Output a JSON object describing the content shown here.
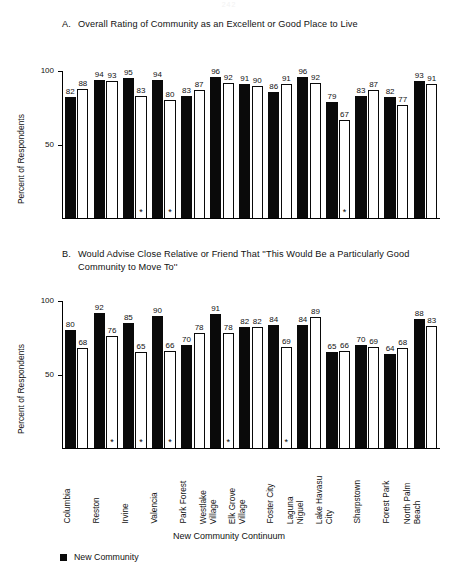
{
  "page": {
    "number": "242"
  },
  "yaxis": {
    "label": "Percent of Respondents",
    "ticks": [
      "100",
      "50"
    ],
    "min": 0,
    "max": 100
  },
  "xaxis": {
    "label": "New Community Continuum"
  },
  "legend": {
    "items": [
      {
        "swatch": "filled-square",
        "label": "New Community"
      }
    ]
  },
  "charts": [
    {
      "letter": "A.",
      "title": "Overall Rating of Community as an Excellent or Good Place to Live"
    },
    {
      "letter": "B.",
      "title": "Would Advise Close Relative or Friend That ''This Would Be a Particularly Good Community to Move To''"
    }
  ],
  "chart_data": [
    {
      "type": "bar",
      "title": "A. Overall Rating of Community as an Excellent or Good Place to Live",
      "xlabel": "New Community Continuum",
      "ylabel": "Percent of Respondents",
      "ylim": [
        0,
        100
      ],
      "yticks": [
        50,
        100
      ],
      "grid": false,
      "legend_position": "bottom-left",
      "categories": [
        "Columbia",
        "Reston",
        "Irvine",
        "Valencia",
        "Park Forest",
        "Westlake Village",
        "Elk Grove Village",
        "Foster City",
        "Laguna Niguel",
        "Lake Havasu City",
        "Sharpstown",
        "Forest Park",
        "North Palm Beach"
      ],
      "series": [
        {
          "name": "New Community",
          "fill": "black",
          "values": [
            82,
            94,
            95,
            94,
            83,
            96,
            91,
            86,
            96,
            79,
            83,
            82,
            93
          ]
        },
        {
          "name": "Conventional Community",
          "fill": "white",
          "values": [
            88,
            93,
            83,
            80,
            87,
            92,
            90,
            91,
            92,
            67,
            87,
            77,
            91
          ]
        }
      ],
      "significance_markers": {
        "series": "Conventional Community",
        "categories": [
          "Irvine",
          "Valencia",
          "Lake Havasu City"
        ]
      }
    },
    {
      "type": "bar",
      "title": "B. Would Advise Close Relative or Friend That ''This Would Be a Particularly Good Community to Move To''",
      "xlabel": "New Community Continuum",
      "ylabel": "Percent of Respondents",
      "ylim": [
        0,
        100
      ],
      "yticks": [
        50,
        100
      ],
      "grid": false,
      "legend_position": "bottom-left",
      "categories": [
        "Columbia",
        "Reston",
        "Irvine",
        "Valencia",
        "Park Forest",
        "Westlake Village",
        "Elk Grove Village",
        "Foster City",
        "Laguna Niguel",
        "Lake Havasu City",
        "Sharpstown",
        "Forest Park",
        "North Palm Beach"
      ],
      "series": [
        {
          "name": "New Community",
          "fill": "black",
          "values": [
            80,
            92,
            85,
            90,
            70,
            91,
            82,
            84,
            84,
            65,
            70,
            64,
            88
          ]
        },
        {
          "name": "Conventional Community",
          "fill": "white",
          "values": [
            68,
            76,
            65,
            66,
            78,
            78,
            82,
            69,
            89,
            66,
            69,
            68,
            83
          ]
        }
      ],
      "significance_markers": {
        "series": "Conventional Community",
        "categories": [
          "Reston",
          "Irvine",
          "Valencia",
          "Westlake Village",
          "Foster City"
        ]
      }
    }
  ],
  "categories_display": [
    {
      "l1": "Columbia",
      "l2": ""
    },
    {
      "l1": "Reston",
      "l2": ""
    },
    {
      "l1": "Irvine",
      "l2": ""
    },
    {
      "l1": "Valencia",
      "l2": ""
    },
    {
      "l1": "Park Forest",
      "l2": ""
    },
    {
      "l1": "Westlake",
      "l2": "Village"
    },
    {
      "l1": "Elk Grove",
      "l2": "Village"
    },
    {
      "l1": "Foster City",
      "l2": ""
    },
    {
      "l1": "Laguna",
      "l2": "Niguel"
    },
    {
      "l1": "Lake Havasu",
      "l2": "City"
    },
    {
      "l1": "Sharpstown",
      "l2": ""
    },
    {
      "l1": "Forest Park",
      "l2": ""
    },
    {
      "l1": "North Palm",
      "l2": "Beach"
    }
  ]
}
